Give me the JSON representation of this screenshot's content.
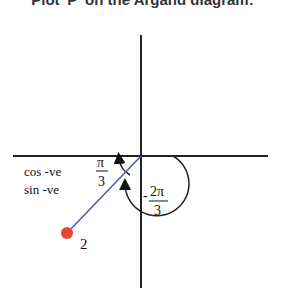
{
  "title": "Plot 'P' on the Argand diagram:",
  "labels": {
    "quadrant_cos": "cos -ve",
    "quadrant_sin": "sin -ve",
    "angle_pi": "π",
    "angle_3": "3",
    "neg_angle_num": "2π",
    "neg_angle_den": "3",
    "neg_sign": "-",
    "modulus": "2"
  },
  "colors": {
    "point": "#e8452c",
    "line": "#4a5fb0",
    "axis": "#222222"
  }
}
